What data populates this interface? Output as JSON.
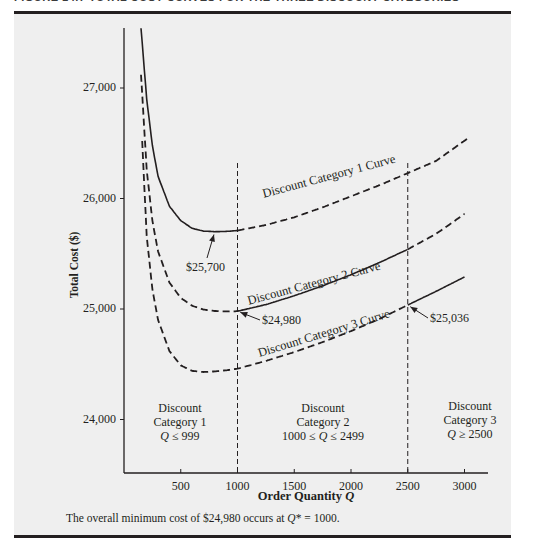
{
  "figure": {
    "heading": "FIGURE 14.7    TOTAL COST CURVES FOR THE THREE DISCOUNT CATEGORIES",
    "caption_prefix": "The overall minimum cost of $24,980 occurs at ",
    "caption_var": "Q",
    "caption_suffix": "* = 1000."
  },
  "chart_data": {
    "type": "line",
    "title": "Total Cost Curves for the Three Discount Categories",
    "xlabel": "Order Quantity Q",
    "xlabel_text": "Order Quantity ",
    "xlabel_var": "Q",
    "ylabel": "Total Cost ($)",
    "xlim": [
      0,
      3200
    ],
    "ylim": [
      23600,
      27600
    ],
    "grid": false,
    "legend": "none (curves labeled inline)",
    "x_ticks": [
      500,
      1000,
      1500,
      2000,
      2500,
      3000
    ],
    "x_tick_labels": [
      "500",
      "1000",
      "1500",
      "2000",
      "2500",
      "3000"
    ],
    "y_ticks": [
      24000,
      25000,
      26000,
      27000
    ],
    "y_tick_labels": [
      "24,000",
      "25,000",
      "26,000",
      "27,000"
    ],
    "breakpoints": [
      1000,
      2500
    ],
    "series": [
      {
        "name": "Discount Category 1 Curve",
        "valid_range": [
          0,
          999
        ],
        "x": [
          150,
          200,
          250,
          300,
          400,
          500,
          600,
          700,
          800,
          900,
          1000,
          1250,
          1500,
          1750,
          2000,
          2250,
          2500,
          2750,
          3050
        ],
        "y": [
          27540,
          26900,
          26480,
          26200,
          25930,
          25800,
          25730,
          25705,
          25700,
          25702,
          25710,
          25760,
          25830,
          25920,
          26020,
          26120,
          26230,
          26340,
          26560
        ]
      },
      {
        "name": "Discount Category 2 Curve",
        "valid_range": [
          1000,
          2499
        ],
        "x": [
          150,
          200,
          250,
          300,
          400,
          500,
          600,
          700,
          800,
          900,
          1000,
          1250,
          1500,
          1750,
          2000,
          2250,
          2500,
          2750,
          3000
        ],
        "y": [
          27120,
          26260,
          25800,
          25520,
          25240,
          25100,
          25030,
          24995,
          24982,
          24978,
          24980,
          25040,
          25120,
          25210,
          25310,
          25420,
          25540,
          25680,
          25860
        ]
      },
      {
        "name": "Discount Category 3 Curve",
        "valid_range": [
          2500,
          3000
        ],
        "x": [
          160,
          200,
          250,
          300,
          400,
          500,
          600,
          700,
          800,
          900,
          1000,
          1250,
          1500,
          1750,
          2000,
          2250,
          2500,
          2750,
          3000
        ],
        "y": [
          26520,
          25660,
          25180,
          24900,
          24620,
          24490,
          24440,
          24430,
          24435,
          24445,
          24460,
          24530,
          24610,
          24700,
          24800,
          24910,
          25036,
          25160,
          25290
        ]
      }
    ],
    "annotations": [
      {
        "text": "$25,700",
        "x": 800,
        "y": 25700,
        "label": "Category 1 minimum"
      },
      {
        "text": "$24,980",
        "x": 1000,
        "y": 24980,
        "label": "Category 2 minimum at Q = 1000"
      },
      {
        "text": "$25,036",
        "x": 2500,
        "y": 25036,
        "label": "Category 3 cost at Q = 2500"
      }
    ],
    "regions": [
      {
        "line1": "Discount",
        "line2": "Category 1",
        "line3_var": "Q",
        "line3": " ≤ 999"
      },
      {
        "line1": "Discount",
        "line2": "Category 2",
        "line3_pre": "1000 ≤ ",
        "line3_var": "Q",
        "line3": " ≤ 2499"
      },
      {
        "line1": "Discount",
        "line2": "Category 3",
        "line3_var": "Q",
        "line3": " ≥ 2500"
      }
    ],
    "colors": {
      "line": "#231f20",
      "panel": "#efefef"
    }
  }
}
